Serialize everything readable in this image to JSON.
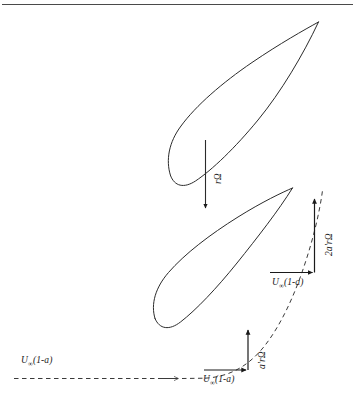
{
  "figure": {
    "title_hidden": "",
    "background_color": "#ffffff",
    "line_color": "#1a1a1a",
    "rule_color": "#4a4a4a"
  },
  "labels": {
    "rotational_speed": "rΩ",
    "tangential_induction_upper": "2a'rΩ",
    "tangential_induction_lower": "a'rΩ",
    "axial_velocity_far": "U",
    "axial_velocity_far_sub": "∞",
    "axial_velocity_far_term": "(1-a)",
    "axial_velocity_mid": "U",
    "axial_velocity_mid_sub": "∞",
    "axial_velocity_mid_term": "(1-a)",
    "axial_velocity_near": "U",
    "axial_velocity_near_sub": "∞",
    "axial_velocity_near_term": "(1-a)"
  },
  "elements": {
    "top_rule": "horizontal-rule",
    "upper_airfoil": "airfoil-section-upper",
    "lower_airfoil": "airfoil-section-lower",
    "rotation_arrow": "downward-rotation-arrow",
    "streamline": "dashed-streamline",
    "upper_vector_triangle": "velocity-triangle-upper",
    "lower_vector_triangle": "velocity-triangle-lower"
  }
}
